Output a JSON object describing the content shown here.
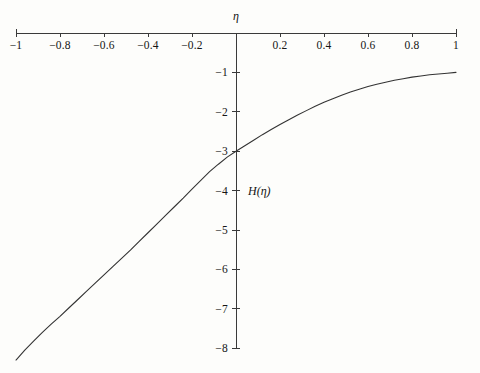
{
  "chart_data": {
    "type": "line",
    "title": "",
    "subtitle": "",
    "xlabel": "η",
    "ylabel": "H(η)",
    "xlim": [
      -1,
      1
    ],
    "ylim": [
      -8,
      0
    ],
    "grid": false,
    "legend": null,
    "x_ticks": [
      -1,
      -0.8,
      -0.6,
      -0.4,
      -0.2,
      0.2,
      0.4,
      0.6,
      0.8,
      1
    ],
    "x_tick_labels": [
      "−1",
      "−0.8",
      "−0.6",
      "−0.4",
      "−0.2",
      "0.2",
      "0.4",
      "0.6",
      "0.8",
      "1"
    ],
    "y_ticks": [
      -1,
      -2,
      -3,
      -4,
      -5,
      -6,
      -7,
      -8
    ],
    "y_tick_labels": [
      "−1",
      "−2",
      "−3",
      "−4",
      "−5",
      "−6",
      "−7",
      "−8"
    ],
    "series": [
      {
        "name": "H(η)",
        "color": "#333333",
        "x": [
          -1.0,
          -0.96,
          -0.92,
          -0.88,
          -0.84,
          -0.8,
          -0.76,
          -0.72,
          -0.68,
          -0.64,
          -0.6,
          -0.56,
          -0.52,
          -0.48,
          -0.44,
          -0.4,
          -0.36,
          -0.32,
          -0.28,
          -0.24,
          -0.2,
          -0.16,
          -0.12,
          -0.08,
          -0.04,
          0.0,
          0.04,
          0.08,
          0.12,
          0.16,
          0.2,
          0.24,
          0.28,
          0.32,
          0.36,
          0.4,
          0.44,
          0.48,
          0.52,
          0.56,
          0.6,
          0.64,
          0.68,
          0.72,
          0.76,
          0.8,
          0.84,
          0.88,
          0.92,
          0.96,
          1.0
        ],
        "y": [
          -8.3,
          -8.05,
          -7.82,
          -7.6,
          -7.39,
          -7.19,
          -6.98,
          -6.77,
          -6.56,
          -6.35,
          -6.14,
          -5.93,
          -5.72,
          -5.51,
          -5.29,
          -5.07,
          -4.85,
          -4.63,
          -4.41,
          -4.19,
          -3.96,
          -3.74,
          -3.52,
          -3.33,
          -3.15,
          -3.0,
          -2.86,
          -2.72,
          -2.58,
          -2.45,
          -2.32,
          -2.2,
          -2.08,
          -1.97,
          -1.86,
          -1.76,
          -1.67,
          -1.58,
          -1.5,
          -1.43,
          -1.36,
          -1.3,
          -1.25,
          -1.2,
          -1.16,
          -1.12,
          -1.09,
          -1.06,
          -1.04,
          -1.02,
          -1.0
        ]
      }
    ],
    "axis_color": "#3a3a3a"
  },
  "geometry": {
    "x_axis_left_px": 16,
    "x_axis_right_px": 456,
    "x_axis_y_px": 33,
    "y_axis_x_px": 236,
    "y_axis_bottom_px": 348,
    "px_per_x_unit": 220,
    "px_per_y_unit": 39.4
  }
}
